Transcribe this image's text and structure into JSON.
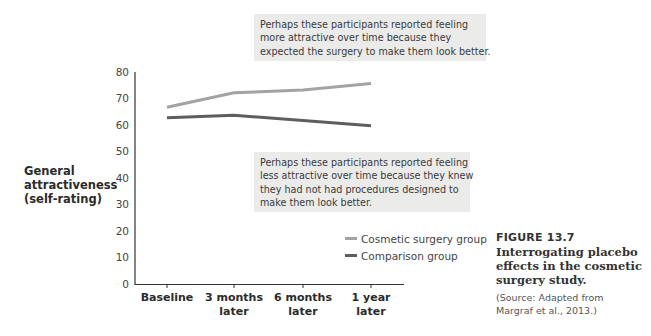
{
  "figure": {
    "number": "FIGURE 13.7",
    "title_lines": [
      "Interrogating placebo",
      "effects in the cosmetic",
      "surgery study."
    ],
    "source_lines": [
      "(Source: Adapted from",
      "Margraf et al., 2013.)"
    ]
  },
  "callouts": {
    "upper_lines": [
      "Perhaps these participants reported feeling",
      "more attractive over time because they",
      "expected the surgery to make them look better."
    ],
    "lower_lines": [
      "Perhaps these participants reported feeling",
      "less attractive over time because they knew",
      "they had not had procedures designed to",
      "make them look better."
    ]
  },
  "axes": {
    "ylabel_lines": [
      "General",
      "attractiveness",
      "(self-rating)"
    ],
    "yticks": [
      "80",
      "70",
      "60",
      "50",
      "40",
      "30",
      "20",
      "10",
      "0"
    ],
    "xticks": [
      {
        "line1": "Baseline",
        "line2": ""
      },
      {
        "line1": "3 months",
        "line2": "later"
      },
      {
        "line1": "6 months",
        "line2": "later"
      },
      {
        "line1": "1 year",
        "line2": "later"
      }
    ]
  },
  "legend": {
    "items": [
      {
        "label": "Cosmetic surgery group",
        "color": "#a3a3a3"
      },
      {
        "label": "Comparison group",
        "color": "#5e5e5e"
      }
    ]
  },
  "colors": {
    "cosmetic": "#a3a3a3",
    "comparison": "#5e5e5e",
    "callout_bg": "#ebebea",
    "axis": "#333333"
  },
  "chart_data": {
    "type": "line",
    "title": "",
    "xlabel": "",
    "ylabel": "General attractiveness (self-rating)",
    "categories": [
      "Baseline",
      "3 months later",
      "6 months later",
      "1 year later"
    ],
    "series": [
      {
        "name": "Cosmetic surgery group",
        "values": [
          67,
          72.5,
          73.5,
          76
        ]
      },
      {
        "name": "Comparison group",
        "values": [
          63,
          64,
          62,
          60
        ]
      }
    ],
    "ylim": [
      0,
      80
    ],
    "yticks": [
      0,
      10,
      20,
      30,
      40,
      50,
      60,
      70,
      80
    ],
    "grid": false,
    "legend_position": "lower right"
  }
}
